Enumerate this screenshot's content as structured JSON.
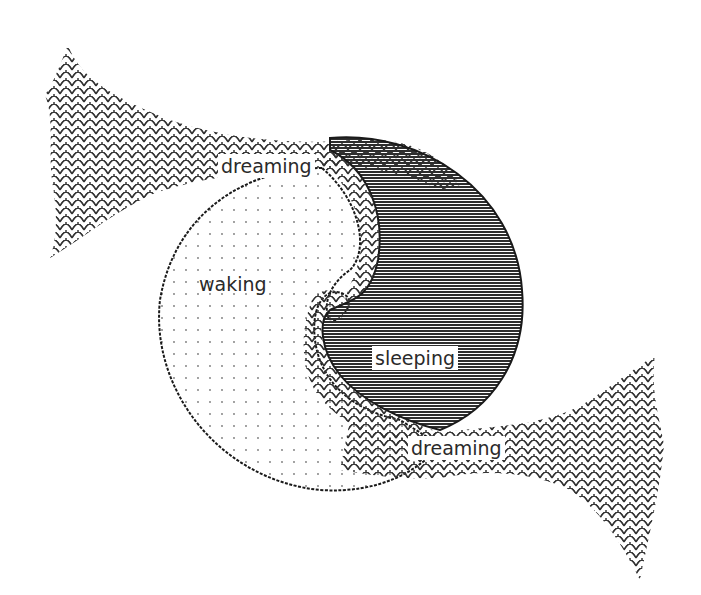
{
  "diagram": {
    "type": "spiral-states",
    "labels": {
      "dreaming_top": "dreaming",
      "waking": "waking",
      "sleeping": "sleeping",
      "dreaming_bottom": "dreaming"
    },
    "regions": [
      {
        "name": "dreaming",
        "fill": "scale-pattern"
      },
      {
        "name": "waking",
        "fill": "dot-pattern"
      },
      {
        "name": "sleeping",
        "fill": "horizontal-lines"
      }
    ],
    "colors": {
      "ink": "#2a2a2a",
      "background": "#ffffff"
    }
  }
}
